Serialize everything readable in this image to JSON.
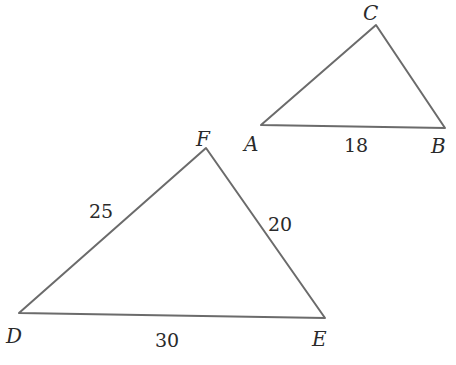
{
  "figure": {
    "triangles": [
      {
        "name": "ABC",
        "vertices": [
          {
            "label": "A",
            "x": 261,
            "y": 125,
            "lx": 244,
            "ly": 151
          },
          {
            "label": "B",
            "x": 445,
            "y": 128,
            "lx": 431,
            "ly": 153
          },
          {
            "label": "C",
            "x": 376,
            "y": 25,
            "lx": 363,
            "ly": 20
          }
        ],
        "sides": [
          {
            "between": "AB",
            "label": "18",
            "lx": 344,
            "ly": 152
          }
        ]
      },
      {
        "name": "DEF",
        "vertices": [
          {
            "label": "D",
            "x": 19,
            "y": 313,
            "lx": 6,
            "ly": 343
          },
          {
            "label": "E",
            "x": 325,
            "y": 318,
            "lx": 312,
            "ly": 346
          },
          {
            "label": "F",
            "x": 206,
            "y": 148,
            "lx": 196,
            "ly": 146
          }
        ],
        "sides": [
          {
            "between": "DF",
            "label": "25",
            "lx": 89,
            "ly": 218
          },
          {
            "between": "FE",
            "label": "20",
            "lx": 268,
            "ly": 231
          },
          {
            "between": "DE",
            "label": "30",
            "lx": 155,
            "ly": 347
          }
        ]
      }
    ],
    "stroke_color": "#6b6b6b"
  }
}
